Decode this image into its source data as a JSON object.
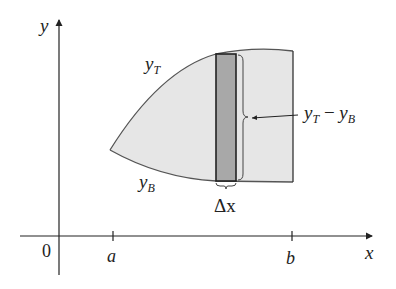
{
  "figure": {
    "axes": {
      "x_label": "x",
      "y_label": "y",
      "origin_label": "0",
      "ticks": [
        {
          "label": "a"
        },
        {
          "label": "b"
        }
      ]
    },
    "curves": {
      "top_label": "y",
      "top_sub": "T",
      "bottom_label": "y",
      "bottom_sub": "B"
    },
    "strip": {
      "width_label": "Δx",
      "height_label_y1": "y",
      "height_label_sub1": "T",
      "height_label_minus": " − ",
      "height_label_y2": "y",
      "height_label_sub2": "B"
    },
    "colors": {
      "region_fill": "#e6e6e6",
      "strip_fill": "#a8a8a8",
      "stroke": "#333333",
      "curve_stroke": "#555555"
    }
  }
}
